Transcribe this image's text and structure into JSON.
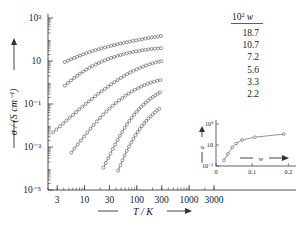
{
  "figure": {
    "background": "#ffffff",
    "ink": "#1a1a1a"
  },
  "chart_data": {
    "type": "line",
    "title": "",
    "xlabel": "T / K",
    "ylabel": "σ / (S cm⁻¹)",
    "xscale": "log",
    "yscale": "log",
    "xlim": [
      2,
      3000
    ],
    "ylim": [
      1e-05,
      1000
    ],
    "xticks": [
      3,
      10,
      30,
      100,
      300,
      1000,
      3000
    ],
    "xtick_labels": [
      "3",
      "10",
      "30",
      "100",
      "300",
      "1000",
      "3000"
    ],
    "yticks": [
      1e-05,
      0.001,
      0.1,
      10,
      1000
    ],
    "ytick_labels": [
      "10⁻⁵",
      "10⁻³",
      "10⁻¹",
      "10",
      "10³"
    ],
    "grid": false,
    "marker": "open-circle",
    "legend_position": "upper-right-outside",
    "legend_title": "10² w",
    "series": [
      {
        "name": "18.7",
        "label": "18.7",
        "x": [
          4.2,
          4.8,
          5.5,
          6.3,
          7.2,
          8.2,
          9.4,
          10.8,
          12.4,
          14.2,
          16.3,
          18.7,
          21.4,
          24.6,
          28.2,
          32.3,
          37.1,
          42.5,
          48.8,
          56.0,
          64.2,
          73.6,
          84.5,
          96.9,
          111.2,
          127.5,
          146.3,
          167.8,
          192.5,
          220.8,
          253.3,
          290.5
        ],
        "y": [
          9.0,
          10.4,
          12.0,
          13.8,
          15.8,
          18.0,
          20.4,
          23.0,
          25.8,
          28.8,
          32.0,
          35.4,
          39.0,
          42.8,
          46.8,
          51.0,
          55.4,
          60.0,
          64.8,
          69.8,
          75.0,
          80.4,
          86.0,
          91.8,
          97.8,
          104.0,
          110.4,
          117.0,
          123.8,
          130.8,
          138.0,
          145.0
        ]
      },
      {
        "name": "10.7",
        "label": "10.7",
        "x": [
          4.2,
          4.8,
          5.5,
          6.3,
          7.2,
          8.2,
          9.4,
          10.8,
          12.4,
          14.2,
          16.3,
          18.7,
          21.4,
          24.6,
          28.2,
          32.3,
          37.1,
          42.5,
          48.8,
          56.0,
          64.2,
          73.6,
          84.5,
          96.9,
          111.2,
          127.5,
          146.3,
          167.8,
          192.5,
          220.8,
          253.3,
          290.5
        ],
        "y": [
          0.72,
          0.95,
          1.25,
          1.62,
          2.05,
          2.6,
          3.2,
          3.95,
          4.8,
          5.8,
          6.9,
          8.1,
          9.4,
          10.8,
          12.3,
          13.9,
          15.5,
          17.2,
          19.0,
          20.8,
          22.6,
          24.4,
          26.2,
          28.0,
          29.8,
          31.6,
          33.2,
          34.8,
          36.2,
          37.5,
          38.6,
          39.5
        ]
      },
      {
        "name": "7.2",
        "label": "7.2",
        "x": [
          2.5,
          2.9,
          3.4,
          3.9,
          4.5,
          5.2,
          6.0,
          6.9,
          7.9,
          9.1,
          10.5,
          12.1,
          13.9,
          16.0,
          18.4,
          21.2,
          24.4,
          28.1,
          32.3,
          37.2,
          42.8,
          49.2,
          56.6,
          65.1,
          74.9,
          86.2,
          99.2,
          114.1,
          131.3,
          151.0,
          173.7,
          199.8,
          229.8,
          264.3,
          296.0
        ],
        "y": [
          0.0048,
          0.0066,
          0.0091,
          0.0125,
          0.017,
          0.023,
          0.031,
          0.042,
          0.056,
          0.075,
          0.1,
          0.132,
          0.175,
          0.23,
          0.3,
          0.39,
          0.5,
          0.64,
          0.82,
          1.04,
          1.3,
          1.62,
          2.0,
          2.45,
          2.95,
          3.5,
          4.1,
          4.8,
          5.5,
          6.2,
          7.0,
          7.8,
          8.6,
          9.3,
          9.8
        ]
      },
      {
        "name": "5.6",
        "label": "5.6",
        "x": [
          5.6,
          6.4,
          7.4,
          8.5,
          9.8,
          11.3,
          13.0,
          14.9,
          17.2,
          19.8,
          22.7,
          26.2,
          30.1,
          34.6,
          39.8,
          45.8,
          52.7,
          60.6,
          69.7,
          80.2,
          92.2,
          106.1,
          122.0,
          140.4,
          161.4,
          185.7,
          213.6,
          245.7,
          282.6
        ],
        "y": [
          0.00055,
          0.00085,
          0.0013,
          0.002,
          0.0031,
          0.0047,
          0.0071,
          0.0105,
          0.0155,
          0.0225,
          0.032,
          0.045,
          0.062,
          0.084,
          0.112,
          0.147,
          0.19,
          0.243,
          0.305,
          0.38,
          0.46,
          0.55,
          0.65,
          0.76,
          0.87,
          0.99,
          1.1,
          1.2,
          1.3
        ]
      },
      {
        "name": "3.3",
        "label": "3.3",
        "x": [
          23.0,
          25.5,
          28.3,
          31.4,
          34.8,
          38.6,
          42.8,
          47.5,
          52.7,
          58.5,
          64.9,
          72.0,
          79.9,
          88.6,
          98.3,
          109.1,
          121.0,
          134.3,
          149.0,
          165.3,
          183.4,
          203.5,
          225.8,
          250.5,
          278.0
        ],
        "y": [
          0.00011,
          0.00018,
          0.0003,
          0.0005,
          0.00082,
          0.0013,
          0.0021,
          0.0033,
          0.0051,
          0.0077,
          0.0113,
          0.0162,
          0.0228,
          0.0315,
          0.0425,
          0.056,
          0.073,
          0.093,
          0.117,
          0.145,
          0.177,
          0.213,
          0.253,
          0.3,
          0.35
        ]
      },
      {
        "name": "2.2",
        "label": "2.2",
        "x": [
          44.0,
          48.4,
          53.2,
          58.5,
          64.4,
          70.8,
          77.9,
          85.7,
          94.2,
          103.6,
          114.0,
          125.4,
          137.9,
          151.7,
          166.9,
          183.6,
          201.9,
          222.1,
          244.3,
          268.8
        ],
        "y": [
          8e-05,
          0.00014,
          0.00024,
          0.0004,
          0.00066,
          0.00105,
          0.0016,
          0.0024,
          0.0035,
          0.005,
          0.0069,
          0.0094,
          0.0125,
          0.0163,
          0.021,
          0.0265,
          0.033,
          0.041,
          0.05,
          0.06
        ]
      }
    ],
    "inset": {
      "type": "line",
      "xlabel": "w",
      "ylabel": "σ",
      "yscale": "log",
      "xlim": [
        0,
        0.21
      ],
      "ylim": [
        0.1,
        1000
      ],
      "xticks": [
        0,
        0.1,
        0.2
      ],
      "xtick_labels": [
        "0",
        "0.1",
        "0.2"
      ],
      "yticks": [
        0.1,
        10,
        1000
      ],
      "ytick_labels": [
        "10⁻¹",
        "10",
        "10³"
      ],
      "marker": "open-circle",
      "x": [
        0.022,
        0.033,
        0.045,
        0.056,
        0.072,
        0.107,
        0.187
      ],
      "y": [
        0.35,
        1.4,
        6.0,
        14.0,
        30.0,
        55.0,
        110.0
      ]
    }
  },
  "axes": {
    "y_title": "σ / (S cm⁻¹)",
    "x_title": "T / K",
    "y_ticks": [
      "10³",
      "10",
      "10⁻¹",
      "10⁻³",
      "10⁻⁵"
    ],
    "x_ticks": [
      "3",
      "10",
      "30",
      "100",
      "300",
      "1000",
      "3000"
    ]
  },
  "legend": {
    "header": "10² w",
    "items": [
      "18.7",
      "10.7",
      "7.2",
      "5.6",
      "3.3",
      "2.2"
    ]
  },
  "inset_labels": {
    "y_title": "σ",
    "x_title": "w",
    "y_ticks": [
      "10³",
      "10",
      "10⁻¹"
    ],
    "x_ticks": [
      "0",
      "0.1",
      "0.2"
    ]
  }
}
